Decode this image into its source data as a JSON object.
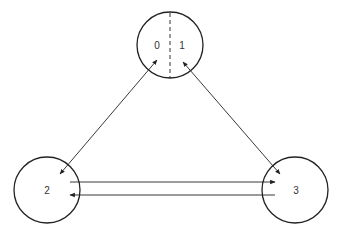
{
  "diagram": {
    "type": "directed-graph",
    "colors": {
      "stroke": "#222222",
      "text": "#333333",
      "background": "#ffffff"
    },
    "nodes": [
      {
        "id": "top",
        "labels": [
          "0",
          "1"
        ],
        "split": true,
        "cx": 170,
        "cy": 45,
        "r": 33
      },
      {
        "id": "n2",
        "labels": [
          "2"
        ],
        "cx": 47,
        "cy": 190,
        "r": 33
      },
      {
        "id": "n3",
        "labels": [
          "3"
        ],
        "cx": 295,
        "cy": 190,
        "r": 33
      }
    ],
    "edges": [
      {
        "from": "2",
        "to": "0",
        "bidirectional": true
      },
      {
        "from": "1",
        "to": "3",
        "bidirectional": true
      },
      {
        "from": "2",
        "to": "3",
        "bidirectional": false
      },
      {
        "from": "3",
        "to": "2",
        "bidirectional": false
      }
    ],
    "label_0": "0",
    "label_1": "1",
    "label_2": "2",
    "label_3": "3"
  }
}
